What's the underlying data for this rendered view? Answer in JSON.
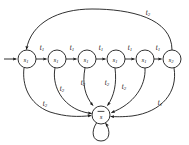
{
  "figure": {
    "type": "finite-state-automaton-diagram",
    "background_color": "#ffffff",
    "stroke_color": "#1a1a1a"
  },
  "nodes": [
    {
      "id": "n1",
      "base": "s",
      "subscript": "1",
      "label": "s1",
      "cx": 27,
      "cy": 59,
      "r": 9
    },
    {
      "id": "n2",
      "base": "s",
      "subscript": "1",
      "label": "s1",
      "cx": 57,
      "cy": 59,
      "r": 9
    },
    {
      "id": "n3",
      "base": "s",
      "subscript": "1",
      "label": "s1",
      "cx": 87,
      "cy": 59,
      "r": 9
    },
    {
      "id": "n4",
      "base": "s",
      "subscript": "1",
      "label": "s1",
      "cx": 116,
      "cy": 59,
      "r": 9
    },
    {
      "id": "n5",
      "base": "s",
      "subscript": "1",
      "label": "s1",
      "cx": 145,
      "cy": 59,
      "r": 9
    },
    {
      "id": "n6",
      "base": "s",
      "subscript": "2",
      "label": "s2",
      "cx": 172,
      "cy": 59,
      "r": 9
    },
    {
      "id": "sink",
      "base": "s",
      "subscript": "",
      "label": "s-bar",
      "overbar": true,
      "cx": 101,
      "cy": 115,
      "r": 9
    }
  ],
  "start_marker": {
    "name": "initial-state-arrow",
    "from_x": 4,
    "to_x": 17,
    "y": 59
  },
  "chain_edges": [
    {
      "from": "n1",
      "to": "n2",
      "label_base": "t",
      "label_sub": "1",
      "label_x": 42,
      "label_y": 48
    },
    {
      "from": "n2",
      "to": "n3",
      "label_base": "t",
      "label_sub": "1",
      "label_x": 72,
      "label_y": 48
    },
    {
      "from": "n3",
      "to": "n4",
      "label_base": "t",
      "label_sub": "1",
      "label_x": 101,
      "label_y": 48
    },
    {
      "from": "n4",
      "to": "n5",
      "label_base": "t",
      "label_sub": "1",
      "label_x": 130,
      "label_y": 48
    },
    {
      "from": "n5",
      "to": "n6",
      "label_base": "t",
      "label_sub": "1",
      "label_x": 158,
      "label_y": 48
    }
  ],
  "sink_edges": [
    {
      "from": "n1",
      "to": "sink",
      "label_base": "t",
      "label_sub": "2",
      "label_x": 45,
      "label_y": 104
    },
    {
      "from": "n2",
      "to": "sink",
      "label_base": "t",
      "label_sub": "2",
      "label_x": 62,
      "label_y": 89
    },
    {
      "from": "n3",
      "to": "sink",
      "label_base": "t",
      "label_sub": "2",
      "label_x": 83,
      "label_y": 83
    },
    {
      "from": "n4",
      "to": "sink",
      "label_base": "t",
      "label_sub": "2",
      "label_x": 107,
      "label_y": 83
    },
    {
      "from": "n5",
      "to": "sink",
      "label_base": "t",
      "label_sub": "2",
      "label_x": 124,
      "label_y": 87
    },
    {
      "from": "n6",
      "to": "sink",
      "label_base": "t",
      "label_sub": "1",
      "label_x": 160,
      "label_y": 103
    }
  ],
  "return_edge": {
    "from": "n6",
    "to": "n1",
    "label_base": "t",
    "label_sub": "2",
    "label_x": 148,
    "label_y": 13
  },
  "self_loop": {
    "at": "sink",
    "name": "self-loop-sink"
  }
}
